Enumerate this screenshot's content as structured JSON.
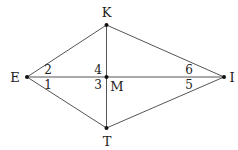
{
  "diagram": {
    "points": {
      "E": {
        "label": "E",
        "x": 27,
        "y": 77
      },
      "K": {
        "label": "K",
        "x": 106.5,
        "y": 25
      },
      "M": {
        "label": "M",
        "x": 106.5,
        "y": 77
      },
      "I": {
        "label": "I",
        "x": 224,
        "y": 77
      },
      "T": {
        "label": "T",
        "x": 106.5,
        "y": 128
      }
    },
    "segments": [
      [
        "E",
        "K"
      ],
      [
        "K",
        "I"
      ],
      [
        "I",
        "T"
      ],
      [
        "T",
        "E"
      ],
      [
        "E",
        "I"
      ],
      [
        "K",
        "T"
      ]
    ],
    "angle_labels": {
      "a1": "1",
      "a2": "2",
      "a3": "3",
      "a4": "4",
      "a5": "5",
      "a6": "6"
    },
    "colors": {
      "line": "#555555",
      "text": "#222222",
      "point": "#111111"
    }
  }
}
